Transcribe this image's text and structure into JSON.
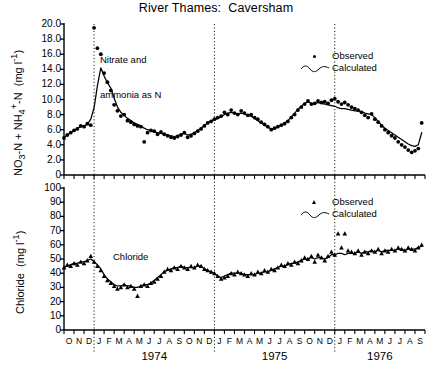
{
  "title": "River Thames:  Caversham",
  "panels": {
    "top": {
      "annotation_line1": "Nitrate and",
      "annotation_line2": "ammonia as N",
      "ylabel_main": "NO3-N + NH4+-N",
      "ylabel_units": "(mg l-1)",
      "ytick_labels": [
        "20.0",
        "18.0",
        "16.0",
        "14.0",
        "12.0",
        "10.0",
        "8.0",
        "6.0",
        "4.0",
        "2.0",
        "0"
      ],
      "legend": [
        {
          "label": "Observed",
          "marker": "dot-marker-icon"
        },
        {
          "label": "Calculated",
          "marker": "wavy-line-icon"
        }
      ]
    },
    "bottom": {
      "annotation_line1": "Chloride",
      "ylabel_main": "Chloride",
      "ylabel_units": "(mg l-1)",
      "ytick_labels": [
        "100",
        "90",
        "80",
        "70",
        "60",
        "50",
        "40",
        "30",
        "20",
        "10",
        "0"
      ],
      "legend": [
        {
          "label": "Observed",
          "marker": "triangle-marker-icon"
        },
        {
          "label": "Calculated",
          "marker": "wavy-line-icon"
        }
      ]
    }
  },
  "xaxis": {
    "month_labels": [
      "O",
      "N",
      "D",
      "J",
      "F",
      "M",
      "A",
      "M",
      "J",
      "J",
      "A",
      "S",
      "O",
      "N",
      "D",
      "J",
      "F",
      "M",
      "A",
      "M",
      "J",
      "J",
      "A",
      "S",
      "O",
      "N",
      "D",
      "J",
      "F",
      "M",
      "A",
      "M",
      "J",
      "J",
      "A",
      "S"
    ],
    "year_labels": [
      "1974",
      "1975",
      "1976"
    ],
    "year_divider_months": [
      3,
      15,
      27
    ]
  },
  "chart_data": [
    {
      "type": "line",
      "panel": "top",
      "title": "Nitrate and ammonia as N",
      "xlabel": "",
      "ylabel": "NO3-N + NH4+-N (mg l-1)",
      "ylim": [
        0,
        20
      ],
      "ytick_step": 2.0,
      "xlim_months": [
        0,
        36
      ],
      "grid": false,
      "legend_position": "top-right",
      "x": [
        0,
        0.33,
        0.67,
        1,
        1.33,
        1.67,
        2,
        2.33,
        2.67,
        3,
        3.33,
        3.67,
        4,
        4.33,
        4.67,
        5,
        5.33,
        5.67,
        6,
        6.33,
        6.67,
        7,
        7.33,
        7.67,
        8,
        8.33,
        8.67,
        9,
        9.33,
        9.67,
        10,
        10.33,
        10.67,
        11,
        11.33,
        11.67,
        12,
        12.33,
        12.67,
        13,
        13.33,
        13.67,
        14,
        14.33,
        14.67,
        15,
        15.33,
        15.67,
        16,
        16.33,
        16.67,
        17,
        17.33,
        17.67,
        18,
        18.33,
        18.67,
        19,
        19.33,
        19.67,
        20,
        20.33,
        20.67,
        21,
        21.33,
        21.67,
        22,
        22.33,
        22.67,
        23,
        23.33,
        23.67,
        24,
        24.33,
        24.67,
        25,
        25.33,
        25.67,
        26,
        26.33,
        26.67,
        27,
        27.33,
        27.67,
        28,
        28.33,
        28.67,
        29,
        29.33,
        29.67,
        30,
        30.33,
        30.67,
        31,
        31.33,
        31.67,
        32,
        32.33,
        32.67,
        33,
        33.33,
        33.67,
        34,
        34.33,
        34.67,
        35,
        35.33,
        35.67
      ],
      "series": [
        {
          "name": "Observed",
          "marker": "dot",
          "values": [
            4.9,
            5.3,
            5.6,
            5.9,
            6.1,
            6.5,
            6.4,
            6.8,
            6.6,
            19.5,
            16.8,
            16.0,
            13.5,
            12.3,
            11.2,
            9.3,
            8.5,
            7.8,
            8.0,
            7.2,
            7.0,
            6.7,
            6.5,
            6.4,
            4.4,
            5.6,
            5.9,
            5.8,
            5.4,
            5.7,
            5.4,
            5.2,
            5.0,
            4.9,
            5.1,
            5.3,
            5.6,
            5.0,
            5.2,
            5.5,
            5.8,
            6.1,
            6.5,
            6.9,
            7.1,
            7.4,
            7.6,
            7.8,
            8.3,
            8.0,
            8.6,
            8.2,
            8.0,
            8.5,
            8.2,
            7.9,
            8.0,
            7.6,
            7.4,
            7.0,
            6.7,
            6.4,
            6.0,
            6.2,
            6.4,
            6.6,
            6.8,
            7.1,
            7.6,
            8.0,
            8.6,
            9.0,
            9.4,
            9.8,
            9.4,
            9.5,
            9.8,
            9.6,
            9.7,
            9.5,
            9.9,
            10.1,
            9.7,
            9.4,
            9.6,
            9.3,
            9.0,
            8.8,
            8.6,
            8.3,
            7.9,
            7.6,
            8.1,
            7.4,
            7.0,
            6.5,
            6.0,
            5.6,
            5.2,
            4.9,
            4.4,
            4.0,
            3.7,
            3.3,
            3.0,
            3.2,
            3.5,
            6.9,
            9.3
          ]
        },
        {
          "name": "Calculated",
          "marker": "line",
          "values": [
            5.0,
            5.3,
            5.6,
            5.9,
            6.2,
            6.4,
            6.5,
            6.7,
            7.4,
            8.9,
            11.8,
            14.2,
            13.1,
            12.2,
            11.5,
            10.2,
            9.0,
            8.3,
            7.9,
            7.5,
            7.2,
            6.9,
            6.7,
            6.5,
            6.2,
            6.0,
            5.9,
            5.7,
            5.6,
            5.5,
            5.4,
            5.3,
            5.2,
            5.1,
            5.2,
            5.4,
            5.5,
            5.3,
            5.4,
            5.6,
            5.9,
            6.2,
            6.6,
            6.9,
            7.2,
            7.3,
            7.5,
            7.7,
            8.0,
            8.2,
            8.3,
            8.2,
            8.1,
            8.2,
            8.1,
            7.9,
            7.8,
            7.5,
            7.2,
            6.9,
            6.6,
            6.3,
            6.1,
            6.2,
            6.4,
            6.6,
            6.9,
            7.2,
            7.7,
            8.2,
            8.7,
            9.1,
            9.5,
            9.7,
            9.5,
            9.4,
            9.6,
            9.5,
            9.4,
            9.3,
            9.2,
            9.1,
            8.9,
            8.8,
            8.8,
            8.7,
            8.6,
            8.5,
            8.5,
            8.4,
            8.2,
            8.1,
            8.0,
            7.6,
            7.1,
            6.6,
            6.2,
            5.9,
            5.6,
            5.3,
            5.0,
            4.7,
            4.4,
            4.1,
            3.9,
            3.8,
            4.0,
            5.6,
            8.6
          ]
        }
      ]
    },
    {
      "type": "line",
      "panel": "bottom",
      "title": "Chloride",
      "xlabel": "",
      "ylabel": "Chloride (mg l-1)",
      "ylim": [
        0,
        100
      ],
      "ytick_step": 10,
      "xlim_months": [
        0,
        36
      ],
      "grid": false,
      "legend_position": "top-right",
      "x": [
        0,
        0.33,
        0.67,
        1,
        1.33,
        1.67,
        2,
        2.33,
        2.67,
        3,
        3.33,
        3.67,
        4,
        4.33,
        4.67,
        5,
        5.33,
        5.67,
        6,
        6.33,
        6.67,
        7,
        7.33,
        7.67,
        8,
        8.33,
        8.67,
        9,
        9.33,
        9.67,
        10,
        10.33,
        10.67,
        11,
        11.33,
        11.67,
        12,
        12.33,
        12.67,
        13,
        13.33,
        13.67,
        14,
        14.33,
        14.67,
        15,
        15.33,
        15.67,
        16,
        16.33,
        16.67,
        17,
        17.33,
        17.67,
        18,
        18.33,
        18.67,
        19,
        19.33,
        19.67,
        20,
        20.33,
        20.67,
        21,
        21.33,
        21.67,
        22,
        22.33,
        22.67,
        23,
        23.33,
        23.67,
        24,
        24.33,
        24.67,
        25,
        25.33,
        25.67,
        26,
        26.33,
        26.67,
        27,
        27.33,
        27.67,
        28,
        28.33,
        28.67,
        29,
        29.33,
        29.67,
        30,
        30.33,
        30.67,
        31,
        31.33,
        31.67,
        32,
        32.33,
        32.67,
        33,
        33.33,
        33.67,
        34,
        34.33,
        34.67,
        35,
        35.33,
        35.67
      ],
      "series": [
        {
          "name": "Observed",
          "marker": "triangle",
          "values": [
            44,
            46,
            45,
            47,
            46,
            48,
            47,
            49,
            52,
            48,
            45,
            42,
            38,
            35,
            33,
            31,
            29,
            30,
            32,
            30,
            31,
            29,
            24,
            31,
            32,
            31,
            33,
            34,
            36,
            38,
            41,
            43,
            42,
            44,
            43,
            45,
            44,
            43,
            45,
            44,
            46,
            45,
            43,
            42,
            41,
            40,
            38,
            36,
            37,
            38,
            40,
            39,
            41,
            40,
            39,
            38,
            40,
            39,
            41,
            40,
            42,
            41,
            43,
            42,
            44,
            46,
            45,
            47,
            46,
            48,
            47,
            49,
            51,
            50,
            52,
            48,
            53,
            51,
            49,
            52,
            55,
            53,
            68,
            58,
            68,
            56,
            55,
            54,
            56,
            53,
            55,
            54,
            56,
            55,
            57,
            54,
            56,
            55,
            57,
            56,
            58,
            57,
            56,
            58,
            57,
            56,
            58,
            60,
            62
          ]
        },
        {
          "name": "Calculated",
          "marker": "line",
          "values": [
            44,
            45,
            46,
            47,
            47,
            48,
            48,
            49,
            50,
            48,
            46,
            43,
            39,
            36,
            34,
            32,
            31,
            31,
            32,
            31,
            31,
            30,
            30,
            31,
            32,
            32,
            33,
            35,
            37,
            39,
            41,
            42,
            43,
            44,
            44,
            45,
            44,
            44,
            44,
            44,
            45,
            45,
            43,
            42,
            41,
            40,
            38,
            37,
            38,
            39,
            40,
            40,
            40,
            40,
            39,
            39,
            39,
            39,
            40,
            40,
            41,
            41,
            42,
            43,
            44,
            45,
            45,
            46,
            47,
            47,
            48,
            49,
            50,
            50,
            51,
            50,
            51,
            51,
            50,
            51,
            53,
            53,
            54,
            54,
            53,
            54,
            54,
            54,
            55,
            54,
            55,
            55,
            56,
            55,
            56,
            55,
            56,
            56,
            56,
            56,
            57,
            57,
            56,
            57,
            57,
            57,
            58,
            59,
            61
          ]
        }
      ]
    }
  ]
}
